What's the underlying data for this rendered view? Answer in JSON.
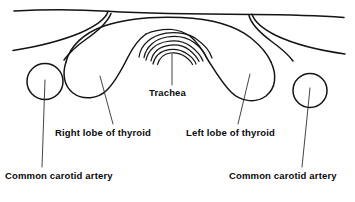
{
  "diagram": {
    "subject": "thyroid",
    "view": "transverse cross-section",
    "background_color": "#ffffff",
    "stroke_color": "#141414",
    "text_color": "#0a0a0a"
  },
  "labels": {
    "trachea": "Trachea",
    "right_lobe": "Right lobe of thyroid",
    "left_lobe": "Left lobe of thyroid",
    "carotid_left": "Common carotid artery",
    "carotid_right": "Common carotid artery"
  },
  "structures": [
    {
      "name": "skin-outline",
      "label": "",
      "description": "horizontal skin surface contour across top of neck"
    },
    {
      "name": "sternocleidomastoid-left",
      "label": "",
      "description": "muscle border sweeping from upper junction down to left edge"
    },
    {
      "name": "sternocleidomastoid-right",
      "label": "",
      "description": "muscle border sweeping from upper junction down to right edge"
    },
    {
      "name": "thyroid-gland",
      "label": "thyroid",
      "description": "butterfly shaped gland arching over the trachea with two lobes"
    },
    {
      "name": "trachea-rings",
      "label": "Trachea",
      "description": "three nested cartilage arcs at the midline",
      "arc_count": 3
    },
    {
      "name": "carotid-artery-left",
      "label": "Common carotid artery",
      "description": "circle on the viewer left side",
      "shape": "circle"
    },
    {
      "name": "carotid-artery-right",
      "label": "Common carotid artery",
      "description": "circle on the viewer right side",
      "shape": "circle"
    }
  ]
}
